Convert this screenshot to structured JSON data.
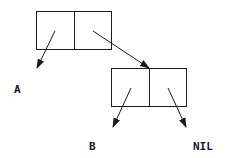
{
  "diagram": {
    "type": "cons-cell-list-structure",
    "stroke_color": "#1a1a1a",
    "background": "#ffffff",
    "cells": [
      {
        "id": "cell1",
        "x": 36,
        "y": 11,
        "width": 76,
        "height": 39,
        "divider_x": 74
      },
      {
        "id": "cell2",
        "x": 111,
        "y": 68,
        "width": 76,
        "height": 39,
        "divider_x": 149
      }
    ],
    "arrows": [
      {
        "from": "cell1.car",
        "to": "A",
        "x1": 55,
        "y1": 31,
        "x2": 37,
        "y2": 68
      },
      {
        "from": "cell1.cdr",
        "to": "cell2",
        "x1": 93,
        "y1": 31,
        "x2": 149,
        "y2": 68
      },
      {
        "from": "cell2.car",
        "to": "B",
        "x1": 131,
        "y1": 88,
        "x2": 113,
        "y2": 127
      },
      {
        "from": "cell2.cdr",
        "to": "NIL",
        "x1": 168,
        "y1": 88,
        "x2": 186,
        "y2": 127
      }
    ],
    "labels": {
      "a": "A",
      "b": "B",
      "nil": "NIL"
    }
  }
}
